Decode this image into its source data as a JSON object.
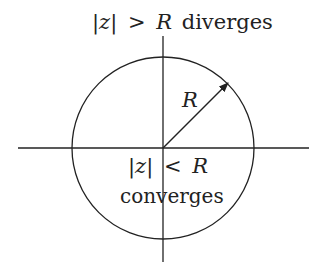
{
  "diagram": {
    "top_label": {
      "abs_z": "|z|",
      "relation": ">",
      "R": "R",
      "text": "diverges"
    },
    "inner_label": {
      "abs_z": "|z|",
      "relation": "<",
      "R": "R",
      "text": "converges"
    },
    "radius_label": "R",
    "geometry": {
      "center": [
        163,
        148
      ],
      "radius": 91
    },
    "colors": {
      "stroke": "#222222",
      "background": "#ffffff"
    }
  }
}
